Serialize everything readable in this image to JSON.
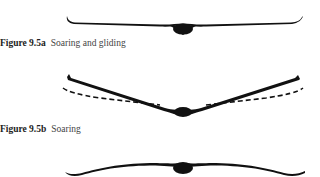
{
  "figures": [
    {
      "id": "9.5a",
      "label": "Figure 9.5a",
      "caption": "Soaring and gliding",
      "silhouette": "flat-wing-upturned-tips"
    },
    {
      "id": "9.5b",
      "label": "Figure 9.5b",
      "caption": "Soaring",
      "silhouette": "dihedral-v-wing-with-dashed-reference"
    },
    {
      "id": "9.5c",
      "label": "",
      "caption": "",
      "silhouette": "gull-wing-downturned-tips"
    }
  ],
  "colors": {
    "ink": "#111111",
    "caption_text": "#444444",
    "background": "#ffffff"
  }
}
